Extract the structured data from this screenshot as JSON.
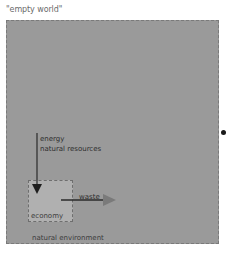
{
  "title": "\"empty world\"",
  "diagram": {
    "outer_box": {
      "label": "natural environment",
      "fill": "#9a9a9a",
      "border": "dashed"
    },
    "inner_box": {
      "label": "economy",
      "fill": "#b0b0b0",
      "border": "dashed"
    },
    "input_arrow": {
      "labels": [
        "energy",
        "natural resources"
      ],
      "direction": "down",
      "color": "#2a2a2a"
    },
    "output_arrow": {
      "label": "waste",
      "direction": "right",
      "color": "#2a2a2a",
      "head_color": "#7a7a7a"
    },
    "marker": {
      "shape": "dot",
      "color": "#1a1a1a"
    }
  }
}
